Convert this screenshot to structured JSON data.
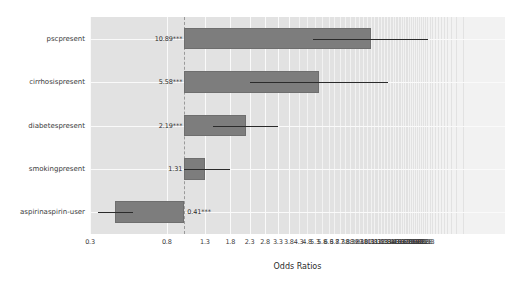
{
  "chart_data": {
    "type": "bar",
    "orientation": "horizontal",
    "title": "",
    "xlabel": "Odds Ratios",
    "ylabel": "",
    "xscale": "log",
    "xlim": [
      0.3,
      60
    ],
    "reference_line": 1,
    "grid": true,
    "legend": null,
    "categories": [
      "pscpresent",
      "cirrhosispresent",
      "diabetespresent",
      "smokingpresent",
      "aspirinaspirin-user"
    ],
    "values": [
      10.89,
      5.58,
      2.19,
      1.31,
      0.41
    ],
    "labels": [
      "10.89***",
      "5.58***",
      "2.19***",
      "1.31",
      "0.41***"
    ],
    "conf_low": [
      5.2,
      2.3,
      1.45,
      1.0,
      0.33
    ],
    "conf_high": [
      22.5,
      13.5,
      3.3,
      1.8,
      0.52
    ],
    "xticks": [
      "0.3",
      "0.8",
      "1.3",
      "1.8",
      "2.3",
      "2.8",
      "3.3",
      "3.8",
      "4.3",
      "4.8",
      "5.3",
      "5.8",
      "6.3",
      "6.8",
      "7.3",
      "7.8",
      "8.3",
      "8.8",
      "9.3",
      "9.8",
      "10.3",
      "10.8",
      "11.3",
      "11.8",
      "12.3",
      "12.8",
      "13.3",
      "13.8",
      "14.3",
      "14.8",
      "15.3",
      "15.8",
      "16.3",
      "16.8",
      "17.3",
      "17.8",
      "18.3",
      "18.8",
      "19.3",
      "19.8",
      "20.3",
      "20.8",
      "21.3",
      "21.8",
      "22.3"
    ],
    "bar_color": "#7d7d7d",
    "panel_color": "#e2e2e2",
    "gridline_color": "#fafafa",
    "errorbar_color": "#2b2b2b"
  }
}
